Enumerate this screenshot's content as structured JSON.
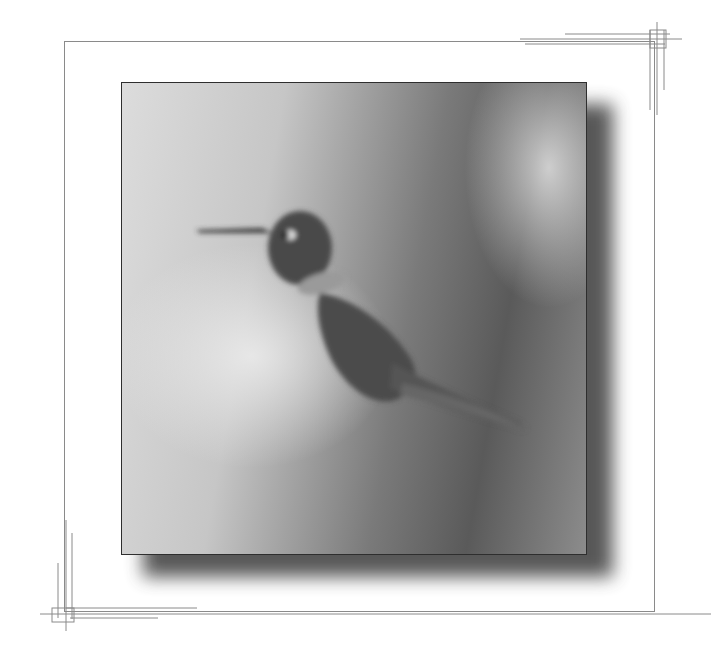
{
  "image": {
    "subject": "hummingbird",
    "style": "grayscale framed photograph",
    "colors": {
      "background": "#ffffff",
      "frame_line": "#8a8a8a",
      "photo_border": "#2e2e2e",
      "shadow": "#3a3a3a",
      "bird_dark": "#3c3c3c"
    }
  }
}
